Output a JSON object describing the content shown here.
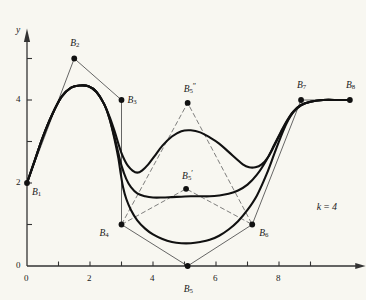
{
  "figure": {
    "parameter_annotation": "k = 4",
    "background_color": "#f8f7f1",
    "curve_color": "#111111",
    "polygon_color": "#555555",
    "axis_color": "#333333"
  },
  "axes": {
    "x_axis_name": "x",
    "y_axis_name": "y",
    "x_ticks": [
      {
        "value": 0,
        "label": "0"
      },
      {
        "value": 1,
        "label": ""
      },
      {
        "value": 2,
        "label": "2"
      },
      {
        "value": 3,
        "label": ""
      },
      {
        "value": 4,
        "label": "4"
      },
      {
        "value": 5,
        "label": ""
      },
      {
        "value": 6,
        "label": "6"
      },
      {
        "value": 7,
        "label": ""
      },
      {
        "value": 8,
        "label": "8"
      },
      {
        "value": 9,
        "label": ""
      }
    ],
    "y_ticks": [
      {
        "value": 0,
        "label": "0"
      },
      {
        "value": 1,
        "label": ""
      },
      {
        "value": 2,
        "label": "2"
      },
      {
        "value": 3,
        "label": ""
      },
      {
        "value": 4,
        "label": "4"
      },
      {
        "value": 5,
        "label": ""
      }
    ],
    "x_range": [
      0,
      10.6
    ],
    "y_range": [
      0,
      5.6
    ]
  },
  "chart_data": {
    "type": "line",
    "title": "",
    "xlabel": "x",
    "ylabel": "y",
    "xlim": [
      0,
      10.6
    ],
    "ylim": [
      0,
      5.6
    ],
    "grid": false,
    "legend": null,
    "annotations": [
      {
        "text": "k = 4",
        "x": 9.2,
        "y": 1.55
      }
    ],
    "control_points": [
      {
        "name": "B1",
        "label": "B",
        "sub": "1",
        "sup": "",
        "x": 0.0,
        "y": 2.0,
        "label_dx": 5,
        "label_dy": 5
      },
      {
        "name": "B2",
        "label": "B",
        "sub": "2",
        "sup": "",
        "x": 1.5,
        "y": 5.0,
        "label_dx": -4,
        "label_dy": -20
      },
      {
        "name": "B3",
        "label": "B",
        "sub": "3",
        "sup": "",
        "x": 3.0,
        "y": 4.0,
        "label_dx": 6,
        "label_dy": -4
      },
      {
        "name": "B4",
        "label": "B",
        "sub": "4",
        "sup": "",
        "x": 3.0,
        "y": 1.0,
        "label_dx": -22,
        "label_dy": 4
      },
      {
        "name": "B5",
        "label": "B",
        "sub": "5",
        "sup": "",
        "x": 5.1,
        "y": 0.0,
        "label_dx": -4,
        "label_dy": 19
      },
      {
        "name": "B6",
        "label": "B",
        "sub": "6",
        "sup": "",
        "x": 7.15,
        "y": 1.0,
        "label_dx": 7,
        "label_dy": 4
      },
      {
        "name": "B7",
        "label": "B",
        "sub": "7",
        "sup": "",
        "x": 8.7,
        "y": 4.0,
        "label_dx": -4,
        "label_dy": -19
      },
      {
        "name": "B8",
        "label": "B",
        "sub": "8",
        "sup": "",
        "x": 10.25,
        "y": 4.0,
        "label_dx": -4,
        "label_dy": -19
      }
    ],
    "variant_points": [
      {
        "name": "B5-prime",
        "label": "B",
        "sub": "5",
        "sup": "′",
        "x": 5.05,
        "y": 1.86,
        "label_dx": -4,
        "label_dy": -19
      },
      {
        "name": "B5-double-prime",
        "label": "B",
        "sub": "5",
        "sup": "″",
        "x": 5.1,
        "y": 3.93,
        "label_dx": -4,
        "label_dy": -20
      }
    ],
    "series": [
      {
        "name": "spline-B5-at-y0",
        "description": "B-spline for control polygon with B5 at (5.1, 0)",
        "points": [
          [
            0,
            2
          ],
          [
            0.25,
            2.55
          ],
          [
            0.5,
            3.1
          ],
          [
            0.8,
            3.65
          ],
          [
            1.1,
            4.08
          ],
          [
            1.4,
            4.3
          ],
          [
            1.7,
            4.35
          ],
          [
            1.95,
            4.33
          ],
          [
            2.2,
            4.2
          ],
          [
            2.45,
            3.9
          ],
          [
            2.62,
            3.55
          ],
          [
            2.78,
            3.05
          ],
          [
            2.9,
            2.6
          ],
          [
            2.98,
            2.2
          ],
          [
            3.05,
            1.9
          ],
          [
            3.15,
            1.62
          ],
          [
            3.3,
            1.35
          ],
          [
            3.5,
            1.1
          ],
          [
            3.75,
            0.9
          ],
          [
            4.0,
            0.76
          ],
          [
            4.3,
            0.65
          ],
          [
            4.6,
            0.58
          ],
          [
            4.9,
            0.55
          ],
          [
            5.2,
            0.55
          ],
          [
            5.5,
            0.58
          ],
          [
            5.8,
            0.63
          ],
          [
            6.1,
            0.73
          ],
          [
            6.4,
            0.88
          ],
          [
            6.7,
            1.08
          ],
          [
            7.0,
            1.35
          ],
          [
            7.3,
            1.7
          ],
          [
            7.6,
            2.2
          ],
          [
            7.85,
            2.7
          ],
          [
            8.05,
            3.1
          ],
          [
            8.25,
            3.45
          ],
          [
            8.45,
            3.7
          ],
          [
            8.7,
            3.87
          ],
          [
            9.0,
            3.96
          ],
          [
            9.4,
            4.0
          ],
          [
            9.9,
            4.0
          ],
          [
            10.25,
            4.0
          ]
        ]
      },
      {
        "name": "spline-B5-prime",
        "description": "B-spline for control polygon with B5 raised to B5' (5.05, 1.86)",
        "points": [
          [
            0,
            2
          ],
          [
            0.25,
            2.55
          ],
          [
            0.5,
            3.1
          ],
          [
            0.8,
            3.65
          ],
          [
            1.1,
            4.08
          ],
          [
            1.4,
            4.3
          ],
          [
            1.7,
            4.35
          ],
          [
            1.95,
            4.33
          ],
          [
            2.2,
            4.2
          ],
          [
            2.45,
            3.9
          ],
          [
            2.62,
            3.55
          ],
          [
            2.78,
            3.1
          ],
          [
            2.9,
            2.72
          ],
          [
            3.0,
            2.42
          ],
          [
            3.15,
            2.1
          ],
          [
            3.3,
            1.9
          ],
          [
            3.5,
            1.75
          ],
          [
            3.75,
            1.68
          ],
          [
            4.0,
            1.65
          ],
          [
            4.3,
            1.65
          ],
          [
            4.6,
            1.66
          ],
          [
            4.9,
            1.67
          ],
          [
            5.2,
            1.68
          ],
          [
            5.5,
            1.68
          ],
          [
            5.8,
            1.68
          ],
          [
            6.1,
            1.7
          ],
          [
            6.4,
            1.74
          ],
          [
            6.7,
            1.82
          ],
          [
            7.0,
            1.96
          ],
          [
            7.3,
            2.2
          ],
          [
            7.6,
            2.55
          ],
          [
            7.85,
            2.92
          ],
          [
            8.05,
            3.22
          ],
          [
            8.25,
            3.5
          ],
          [
            8.45,
            3.72
          ],
          [
            8.7,
            3.88
          ],
          [
            9.0,
            3.96
          ],
          [
            9.4,
            4.0
          ],
          [
            9.9,
            4.0
          ],
          [
            10.25,
            4.0
          ]
        ]
      },
      {
        "name": "spline-B5-double-prime",
        "description": "B-spline for control polygon with B5 raised to B5'' (5.1, 3.93)",
        "points": [
          [
            0,
            2
          ],
          [
            0.25,
            2.55
          ],
          [
            0.5,
            3.1
          ],
          [
            0.8,
            3.65
          ],
          [
            1.1,
            4.08
          ],
          [
            1.4,
            4.3
          ],
          [
            1.7,
            4.35
          ],
          [
            1.95,
            4.33
          ],
          [
            2.2,
            4.2
          ],
          [
            2.45,
            3.9
          ],
          [
            2.62,
            3.6
          ],
          [
            2.78,
            3.25
          ],
          [
            2.9,
            2.95
          ],
          [
            3.0,
            2.72
          ],
          [
            3.1,
            2.55
          ],
          [
            3.2,
            2.42
          ],
          [
            3.35,
            2.3
          ],
          [
            3.5,
            2.25
          ],
          [
            3.65,
            2.3
          ],
          [
            3.85,
            2.45
          ],
          [
            4.05,
            2.65
          ],
          [
            4.3,
            2.9
          ],
          [
            4.6,
            3.12
          ],
          [
            4.9,
            3.25
          ],
          [
            5.2,
            3.27
          ],
          [
            5.5,
            3.22
          ],
          [
            5.8,
            3.1
          ],
          [
            6.1,
            2.95
          ],
          [
            6.4,
            2.75
          ],
          [
            6.65,
            2.58
          ],
          [
            6.85,
            2.45
          ],
          [
            7.05,
            2.38
          ],
          [
            7.25,
            2.38
          ],
          [
            7.45,
            2.45
          ],
          [
            7.65,
            2.62
          ],
          [
            7.85,
            2.9
          ],
          [
            8.05,
            3.2
          ],
          [
            8.25,
            3.48
          ],
          [
            8.45,
            3.71
          ],
          [
            8.7,
            3.88
          ],
          [
            9.0,
            3.96
          ],
          [
            9.4,
            4.0
          ],
          [
            9.9,
            4.0
          ],
          [
            10.25,
            4.0
          ]
        ]
      }
    ],
    "polygon_segments": [
      {
        "name": "poly-main",
        "points": [
          [
            0,
            2
          ],
          [
            1.5,
            5
          ],
          [
            3,
            4
          ],
          [
            3,
            1
          ],
          [
            5.1,
            0
          ],
          [
            7.15,
            1
          ],
          [
            8.7,
            4
          ],
          [
            10.25,
            4
          ]
        ]
      },
      {
        "name": "poly-b5-prime",
        "points": [
          [
            3,
            1
          ],
          [
            5.05,
            1.86
          ],
          [
            7.15,
            1
          ]
        ]
      },
      {
        "name": "poly-b5-double-prime",
        "points": [
          [
            3,
            1
          ],
          [
            5.1,
            3.93
          ],
          [
            7.15,
            1
          ]
        ]
      }
    ]
  }
}
